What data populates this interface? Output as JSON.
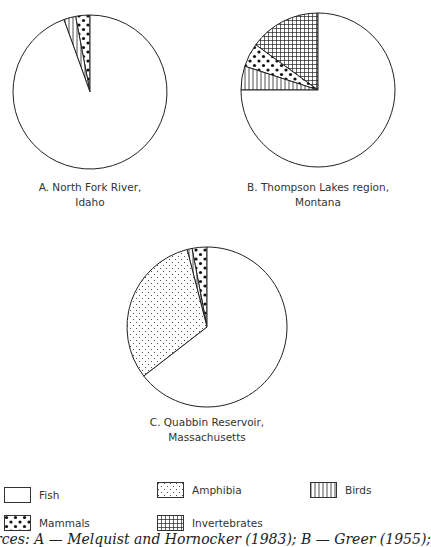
{
  "chart_data": [
    {
      "type": "pie",
      "title": "A. North Fork River, Idaho",
      "caption_lines": [
        "A. North Fork River,",
        "Idaho"
      ],
      "center": [
        90,
        92
      ],
      "radius": 77,
      "slices": [
        {
          "label": "Mammals",
          "value": 3,
          "pattern": "mammals"
        },
        {
          "label": "Birds",
          "value": 2.5,
          "pattern": "birds"
        },
        {
          "label": "Fish",
          "value": 94.5,
          "pattern": "fish"
        }
      ]
    },
    {
      "type": "pie",
      "title": "B. Thompson Lakes region, Montana",
      "caption_lines": [
        "B. Thompson Lakes region,",
        "Montana"
      ],
      "center": [
        318,
        90
      ],
      "radius": 77,
      "slices": [
        {
          "label": "Invertebrates",
          "value": 15,
          "pattern": "inverts"
        },
        {
          "label": "Mammals",
          "value": 5,
          "pattern": "mammals"
        },
        {
          "label": "Birds",
          "value": 5,
          "pattern": "birds"
        },
        {
          "label": "Fish",
          "value": 75,
          "pattern": "fish"
        }
      ]
    },
    {
      "type": "pie",
      "title": "C. Quabbin Reservoir, Massachusetts",
      "caption_lines": [
        "C. Quabbin Reservoir,",
        "Massachusetts"
      ],
      "center": [
        207,
        327
      ],
      "radius": 80,
      "slices": [
        {
          "label": "Mammals",
          "value": 3,
          "pattern": "mammals"
        },
        {
          "label": "Birds",
          "value": 1,
          "pattern": "birds"
        },
        {
          "label": "Amphibia",
          "value": 31.5,
          "pattern": "amphibia"
        },
        {
          "label": "Fish",
          "value": 64.5,
          "pattern": "fish"
        }
      ]
    }
  ],
  "legend": [
    {
      "label": "Fish",
      "pattern": "fish"
    },
    {
      "label": "Amphibia",
      "pattern": "amphibia"
    },
    {
      "label": "Birds",
      "pattern": "birds"
    },
    {
      "label": "Mammals",
      "pattern": "mammals"
    },
    {
      "label": "Invertebrates",
      "pattern": "inverts"
    }
  ],
  "sources_text": "urces: A — Melquist and Hornocker (1983); B — Greer (1955);"
}
